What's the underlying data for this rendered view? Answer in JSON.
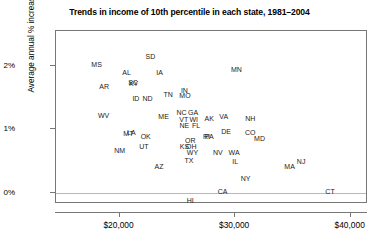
{
  "chart_data": {
    "type": "scatter",
    "title": "Trends in income of 10th percentile in each state, 1981–2004",
    "xlabel": "",
    "ylabel": "Average annual % increase",
    "xlim": [
      14500,
      41500
    ],
    "ylim": [
      -0.18,
      2.55
    ],
    "grid": false,
    "legend": null,
    "xticks": [
      {
        "value": 20000,
        "label": "$20,000"
      },
      {
        "value": 30000,
        "label": "$30,000"
      },
      {
        "value": 40000,
        "label": "$40,000"
      }
    ],
    "yticks": [
      {
        "value": 0,
        "label": "0%"
      },
      {
        "value": 1,
        "label": "1%"
      },
      {
        "value": 2,
        "label": "2%"
      }
    ],
    "point_label_type": "state-abbreviation",
    "points": [
      {
        "label": "MS",
        "x": 18100,
        "y": 2.02
      },
      {
        "label": "AR",
        "x": 18750,
        "y": 1.66
      },
      {
        "label": "WV",
        "x": 18700,
        "y": 1.21
      },
      {
        "label": "AL",
        "x": 20700,
        "y": 1.88
      },
      {
        "label": "SC",
        "x": 21250,
        "y": 1.73
      },
      {
        "label": "KY",
        "x": 21300,
        "y": 1.71
      },
      {
        "label": "SD",
        "x": 22750,
        "y": 2.14
      },
      {
        "label": "IA",
        "x": 23550,
        "y": 1.88
      },
      {
        "label": "ID",
        "x": 21500,
        "y": 1.47
      },
      {
        "label": "ND",
        "x": 22500,
        "y": 1.47
      },
      {
        "label": "TN",
        "x": 24300,
        "y": 1.54
      },
      {
        "label": "IN",
        "x": 25700,
        "y": 1.6
      },
      {
        "label": "MO",
        "x": 25750,
        "y": 1.52
      },
      {
        "label": "MN",
        "x": 30200,
        "y": 1.94
      },
      {
        "label": "ME",
        "x": 23900,
        "y": 1.19
      },
      {
        "label": "NC",
        "x": 25450,
        "y": 1.25
      },
      {
        "label": "GA",
        "x": 26450,
        "y": 1.25
      },
      {
        "label": "VT",
        "x": 25650,
        "y": 1.15
      },
      {
        "label": "WI",
        "x": 26500,
        "y": 1.14
      },
      {
        "label": "NE",
        "x": 25700,
        "y": 1.05
      },
      {
        "label": "FL",
        "x": 26700,
        "y": 1.05
      },
      {
        "label": "AK",
        "x": 27850,
        "y": 1.16
      },
      {
        "label": "VA",
        "x": 29100,
        "y": 1.2
      },
      {
        "label": "NH",
        "x": 31400,
        "y": 1.16
      },
      {
        "label": "DE",
        "x": 29300,
        "y": 0.95
      },
      {
        "label": "CO",
        "x": 31400,
        "y": 0.94
      },
      {
        "label": "MD",
        "x": 32200,
        "y": 0.84
      },
      {
        "label": "MT",
        "x": 20850,
        "y": 0.93
      },
      {
        "label": "LA",
        "x": 21100,
        "y": 0.94
      },
      {
        "label": "OK",
        "x": 22350,
        "y": 0.88
      },
      {
        "label": "UT",
        "x": 22200,
        "y": 0.72
      },
      {
        "label": "NM",
        "x": 20100,
        "y": 0.66
      },
      {
        "label": "AZ",
        "x": 23500,
        "y": 0.4
      },
      {
        "label": "OR",
        "x": 26200,
        "y": 0.82
      },
      {
        "label": "RI",
        "x": 27600,
        "y": 0.88
      },
      {
        "label": "PA",
        "x": 27850,
        "y": 0.88
      },
      {
        "label": "KS",
        "x": 25700,
        "y": 0.72
      },
      {
        "label": "OH",
        "x": 26300,
        "y": 0.72
      },
      {
        "label": "WY",
        "x": 26400,
        "y": 0.62
      },
      {
        "label": "TX",
        "x": 26100,
        "y": 0.5
      },
      {
        "label": "NV",
        "x": 28600,
        "y": 0.62
      },
      {
        "label": "WA",
        "x": 30000,
        "y": 0.62
      },
      {
        "label": "IL",
        "x": 30100,
        "y": 0.48
      },
      {
        "label": "MA",
        "x": 34800,
        "y": 0.4
      },
      {
        "label": "NJ",
        "x": 35800,
        "y": 0.48
      },
      {
        "label": "NY",
        "x": 31000,
        "y": 0.21
      },
      {
        "label": "CA",
        "x": 29000,
        "y": 0.01
      },
      {
        "label": "CT",
        "x": 38300,
        "y": 0.01
      },
      {
        "label": "HI",
        "x": 26200,
        "y": -0.13
      }
    ]
  }
}
